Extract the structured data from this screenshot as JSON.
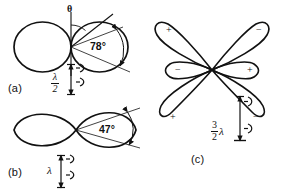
{
  "figure": {
    "background_color": "#ffffff",
    "ink_color": "#111111",
    "panels": [
      {
        "id": "a",
        "label": "(a)",
        "pattern": "two-lobe cardioid pair",
        "beamwidth_label": "78°",
        "angle_symbol": "θ",
        "spacing_numerator": "λ",
        "spacing_denominator": "2",
        "element_count": 2
      },
      {
        "id": "b",
        "label": "(b)",
        "pattern": "figure-eight two-lobe",
        "beamwidth_label": "47°",
        "spacing_label": "λ",
        "element_count": 2
      },
      {
        "id": "c",
        "label": "(c)",
        "pattern": "six-lobe clover",
        "spacing_numerator": "3",
        "spacing_denominator": "2",
        "spacing_symbol": "λ",
        "element_count": 2,
        "lobe_signs": [
          {
            "position": "upper-left",
            "sign": "+"
          },
          {
            "position": "upper-right",
            "sign": "−"
          },
          {
            "position": "middle-left",
            "sign": "−"
          },
          {
            "position": "middle-right",
            "sign": "+"
          },
          {
            "position": "lower-left",
            "sign": "+"
          },
          {
            "position": "lower-right",
            "sign": "−"
          }
        ]
      }
    ]
  }
}
